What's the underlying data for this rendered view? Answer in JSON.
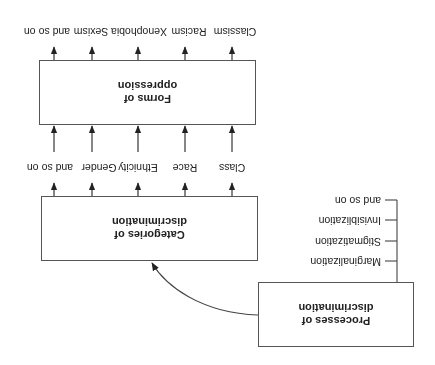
{
  "diagram": {
    "orientation": "rotated-180",
    "processes_box": {
      "title_line1": "Processes of",
      "title_line2": "discrimination"
    },
    "processes_list": [
      "Marginalization",
      "Stigmatization",
      "Invisiblization",
      "and so on"
    ],
    "categories_box": {
      "title_line1": "Categories of",
      "title_line2": "discrimination"
    },
    "categories": [
      "Class",
      "Race",
      "Ethnicity",
      "Gender",
      "and so on"
    ],
    "forms_box": {
      "title_line1": "Forms of",
      "title_line2": "oppression"
    },
    "forms": [
      "Classism",
      "Racism",
      "Xenophobia",
      "Sexism",
      "and so on"
    ],
    "colors": {
      "line": "#333333",
      "box_border": "#555555",
      "text": "#222222"
    }
  }
}
